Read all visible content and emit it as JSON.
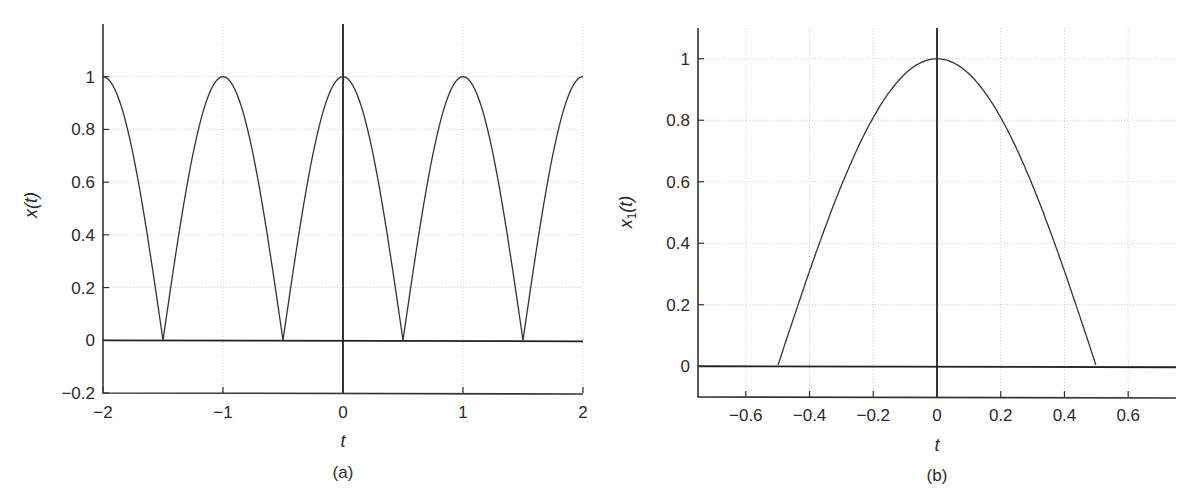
{
  "figure": {
    "panels": [
      "a",
      "b"
    ]
  },
  "chart_data": [
    {
      "id": "a",
      "type": "line",
      "title": "",
      "caption": "(a)",
      "xlabel": "t",
      "ylabel": "x(t)",
      "ylabel_main": "x",
      "ylabel_sub": "",
      "ylabel_tail": "(t)",
      "function": "|cos(pi t)|",
      "xlim": [
        -2,
        2
      ],
      "ylim": [
        -0.2,
        1.2
      ],
      "xticks": [
        -2,
        -1,
        0,
        1,
        2
      ],
      "xtick_labels": [
        "−2",
        "−1",
        "0",
        "1",
        "2"
      ],
      "yticks": [
        -0.2,
        0,
        0.2,
        0.4,
        0.6,
        0.8,
        1
      ],
      "ytick_labels": [
        "−0.2",
        "0",
        "0.2",
        "0.4",
        "0.6",
        "0.8",
        "1"
      ],
      "grid": true,
      "x": [
        -2,
        -1.5,
        -1,
        -0.5,
        0,
        0.5,
        1,
        1.5,
        2
      ],
      "values": [
        1,
        0,
        1,
        0,
        1,
        0,
        1,
        0,
        1
      ],
      "pixel_box": {
        "left": 103,
        "right": 583,
        "top": 24,
        "bottom": 393,
        "ymin": -0.2,
        "ymax": 1.2
      },
      "caption_pos": {
        "x": 343,
        "tick_y": 418,
        "label_y": 447,
        "caption_y": 478
      },
      "ylabel_pos": {
        "x": 37,
        "y": 205
      }
    },
    {
      "id": "b",
      "type": "line",
      "title": "",
      "caption": "(b)",
      "xlabel": "t",
      "ylabel": "x₁(t)",
      "ylabel_main": "x",
      "ylabel_sub": "1",
      "ylabel_tail": "(t)",
      "function": "cos(pi t) for |t| < 0.5, else 0",
      "xlim": [
        -0.75,
        0.75
      ],
      "ylim": [
        -0.1,
        1.1
      ],
      "xticks": [
        -0.6,
        -0.4,
        -0.2,
        0,
        0.2,
        0.4,
        0.6
      ],
      "xtick_labels": [
        "−0.6",
        "−0.4",
        "−0.2",
        "0",
        "0.2",
        "0.4",
        "0.6"
      ],
      "yticks": [
        0,
        0.2,
        0.4,
        0.6,
        0.8,
        1
      ],
      "ytick_labels": [
        "0",
        "0.2",
        "0.4",
        "0.6",
        "0.8",
        "1"
      ],
      "grid": true,
      "x": [
        -0.75,
        -0.5,
        -0.4,
        -0.3,
        -0.2,
        -0.1,
        0,
        0.1,
        0.2,
        0.3,
        0.4,
        0.5,
        0.75
      ],
      "values": [
        0,
        0,
        0.31,
        0.59,
        0.81,
        0.95,
        1,
        0.95,
        0.81,
        0.59,
        0.31,
        0,
        0
      ],
      "pixel_box": {
        "left": 698,
        "right": 1176,
        "top": 28,
        "bottom": 397,
        "ymin": -0.1,
        "ymax": 1.1
      },
      "caption_pos": {
        "x": 937,
        "tick_y": 421,
        "label_y": 451,
        "caption_y": 481
      },
      "ylabel_pos": {
        "x": 632,
        "y": 212
      }
    }
  ]
}
